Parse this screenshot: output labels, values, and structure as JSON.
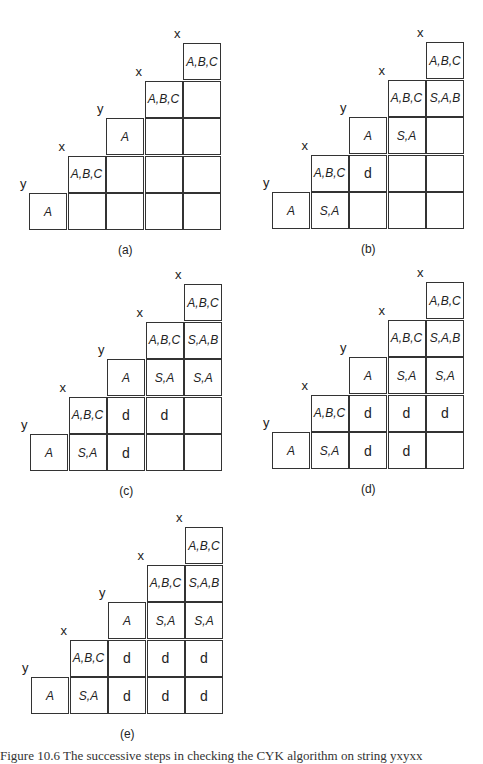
{
  "figures": [
    {
      "id": "a",
      "label": "(a)",
      "left": 29,
      "top": 43,
      "vars": [
        "y",
        "x",
        "y",
        "x",
        "x"
      ],
      "rows": [
        [
          "A",
          "",
          "",
          "",
          ""
        ],
        [
          "A,B,C",
          "",
          "",
          ""
        ],
        [
          "A",
          "",
          ""
        ],
        [
          "A,B,C",
          ""
        ],
        [
          "A,B,C"
        ]
      ]
    },
    {
      "id": "b",
      "label": "(b)",
      "left": 272,
      "top": 42,
      "vars": [
        "y",
        "x",
        "y",
        "x",
        "x"
      ],
      "rows": [
        [
          "A",
          "S,A",
          "",
          "",
          ""
        ],
        [
          "A,B,C",
          "d",
          "",
          ""
        ],
        [
          "A",
          "S,A",
          ""
        ],
        [
          "A,B,C",
          "S,A,B"
        ],
        [
          "A,B,C"
        ]
      ]
    },
    {
      "id": "c",
      "label": "(c)",
      "left": 30,
      "top": 284,
      "vars": [
        "y",
        "x",
        "y",
        "x",
        "x"
      ],
      "rows": [
        [
          "A",
          "S,A",
          "d",
          "",
          ""
        ],
        [
          "A,B,C",
          "d",
          "d",
          ""
        ],
        [
          "A",
          "S,A",
          "S,A"
        ],
        [
          "A,B,C",
          "S,A,B"
        ],
        [
          "A,B,C"
        ]
      ]
    },
    {
      "id": "d",
      "label": "(d)",
      "left": 272,
      "top": 282,
      "vars": [
        "y",
        "x",
        "y",
        "x",
        "x"
      ],
      "rows": [
        [
          "A",
          "S,A",
          "d",
          "d",
          ""
        ],
        [
          "A,B,C",
          "d",
          "d",
          "d"
        ],
        [
          "A",
          "S,A",
          "S,A"
        ],
        [
          "A,B,C",
          "S,A,B"
        ],
        [
          "A,B,C"
        ]
      ]
    },
    {
      "id": "e",
      "label": "(e)",
      "left": 31,
      "top": 527,
      "vars": [
        "y",
        "x",
        "y",
        "x",
        "x"
      ],
      "rows": [
        [
          "A",
          "S,A",
          "d",
          "d",
          "d"
        ],
        [
          "A,B,C",
          "d",
          "d",
          "d"
        ],
        [
          "A",
          "S,A",
          "S,A"
        ],
        [
          "A,B,C",
          "S,A,B"
        ],
        [
          "A,B,C"
        ]
      ]
    }
  ],
  "caption": "Figure 10.6 The successive steps in checking the CYK algorithm on string yxyxx"
}
